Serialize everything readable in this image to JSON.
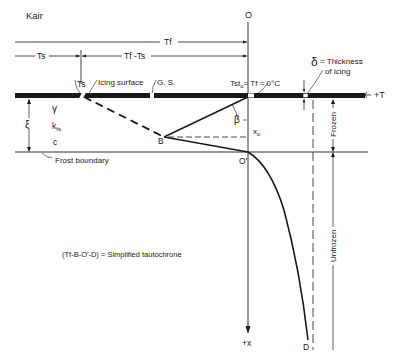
{
  "diagram": {
    "labels": {
      "k_air": "Kair",
      "T_f_top": "Tf",
      "T_s_dim": "Ts",
      "Tf_minus_Ts": "Tf -Ts",
      "O": "O",
      "T_s_point": "Ts",
      "icing_surface": "Icing surface",
      "gs": "G. S.",
      "T_st_eq": "Tst",
      "T_st_sub": "o",
      "T_f_eq": "= Tf = 0°C",
      "delta_symbol": "δ",
      "delta_text_1": "= Thickness",
      "delta_text_2": "of icing",
      "plus_T": "+T",
      "gamma": "γ",
      "k_fs": "kfs",
      "c": "c",
      "xi": "ξ",
      "beta": "β",
      "x_o": "xo",
      "B": "B",
      "O_prime": "O'",
      "frost_boundary": "Frost boundary",
      "frozen": "Frozen",
      "unfrozen": "Unfrozen",
      "tautochrone": "(Tf-B-O'-D) = Simplified tautochrone",
      "plus_x": "+x",
      "D": "D"
    },
    "colors": {
      "ink": "#1a1a1a",
      "background": "#ffffff"
    }
  }
}
